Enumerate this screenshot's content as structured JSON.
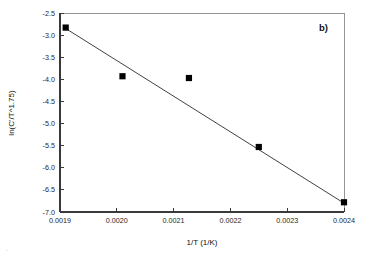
{
  "figure": {
    "panel_label": "b)",
    "bottom_strip_text": "."
  },
  "chart_data": {
    "type": "scatter",
    "title": "",
    "xlabel": "1/T  (1/K)",
    "ylabel": "ln(C'/T^1.75)",
    "xlim": [
      0.0019,
      0.0024
    ],
    "ylim": [
      -7.0,
      -2.5
    ],
    "xticks": [
      0.0019,
      0.002,
      0.0021,
      0.0022,
      0.0023,
      0.0024
    ],
    "xticklabels": [
      "0.0019",
      "0.0020",
      "0.0021",
      "0.0022",
      "0.0023",
      "0.0024"
    ],
    "yticks": [
      -7.0,
      -6.5,
      -6.0,
      -5.5,
      -5.0,
      -4.5,
      -4.0,
      -3.5,
      -3.0,
      -2.5
    ],
    "yticklabels": [
      "-7.0",
      "-6.5",
      "-6.0",
      "-5.5",
      "-5.0",
      "-4.5",
      "-4.0",
      "-3.5",
      "-3.0",
      "-2.5"
    ],
    "grid": false,
    "legend": null,
    "marker_style": "filled-square",
    "marker_color": "#000000",
    "line_color": "#2b2b2b",
    "series": [
      {
        "name": "data",
        "x": [
          0.00191,
          0.00201,
          0.002127,
          0.00225,
          0.0024
        ],
        "y": [
          -2.83,
          -3.93,
          -3.97,
          -5.53,
          -6.78
        ]
      }
    ],
    "fit_line": {
      "name": "linear fit",
      "x": [
        0.00191,
        0.0024
      ],
      "y": [
        -2.85,
        -6.8
      ]
    }
  }
}
